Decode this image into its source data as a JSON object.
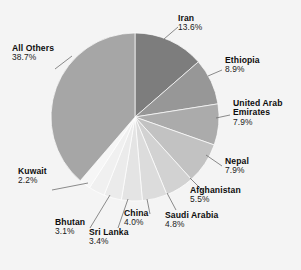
{
  "chart_data": {
    "type": "pie",
    "title": "",
    "subtitle": "",
    "xlabel": "",
    "ylabel": "",
    "legend_position": "none",
    "grid": false,
    "units": "percent",
    "categories": [
      "Iran",
      "Ethiopia",
      "United Arab Emirates",
      "Nepal",
      "Afghanistan",
      "Saudi Arabia",
      "China",
      "Sri Lanka",
      "Bhutan",
      "Kuwait",
      "All Others"
    ],
    "values": [
      13.6,
      8.9,
      7.9,
      7.9,
      5.5,
      4.8,
      4.0,
      3.4,
      3.1,
      2.2,
      38.7
    ],
    "slice_colors": [
      "#7d7d7d",
      "#979797",
      "#ababab",
      "#c2c2c2",
      "#d2d2d2",
      "#dcdcdc",
      "#e4e4e4",
      "#ebebeb",
      "#f0f0f0",
      "#f6f6f6",
      "#a6a6a6"
    ],
    "slices": [
      {
        "label": "Iran",
        "value": 13.6,
        "percent_text": "13.6%",
        "color": "#7d7d7d"
      },
      {
        "label": "Ethiopia",
        "value": 8.9,
        "percent_text": "8.9%",
        "color": "#979797"
      },
      {
        "label": "United Arab Emirates",
        "value": 7.9,
        "percent_text": "7.9%",
        "color": "#ababab"
      },
      {
        "label": "Nepal",
        "value": 7.9,
        "percent_text": "7.9%",
        "color": "#c2c2c2"
      },
      {
        "label": "Afghanistan",
        "value": 5.5,
        "percent_text": "5.5%",
        "color": "#d2d2d2"
      },
      {
        "label": "Saudi Arabia",
        "value": 4.8,
        "percent_text": "4.8%",
        "color": "#dcdcdc"
      },
      {
        "label": "China",
        "value": 4.0,
        "percent_text": "4.0%",
        "color": "#e4e4e4"
      },
      {
        "label": "Sri Lanka",
        "value": 3.4,
        "percent_text": "3.4%",
        "color": "#ebebeb"
      },
      {
        "label": "Bhutan",
        "value": 3.1,
        "percent_text": "3.1%",
        "color": "#f0f0f0"
      },
      {
        "label": "Kuwait",
        "value": 2.2,
        "percent_text": "2.2%",
        "color": "#f6f6f6"
      },
      {
        "label": "All Others",
        "value": 38.7,
        "percent_text": "38.7%",
        "color": "#a6a6a6"
      }
    ],
    "background_color": "#f4f4f4"
  },
  "labels": {
    "iran": {
      "name": "Iran",
      "percent": "13.6%"
    },
    "ethiopia": {
      "name": "Ethiopia",
      "percent": "8.9%"
    },
    "uae": {
      "name": "United Arab",
      "name2": "Emirates",
      "percent": "7.9%"
    },
    "nepal": {
      "name": "Nepal",
      "percent": "7.9%"
    },
    "afghanistan": {
      "name": "Afghanistan",
      "percent": "5.5%"
    },
    "saudi": {
      "name": "Saudi Arabia",
      "percent": "4.8%"
    },
    "china": {
      "name": "China",
      "percent": "4.0%"
    },
    "srilanka": {
      "name": "Sri Lanka",
      "percent": "3.4%"
    },
    "bhutan": {
      "name": "Bhutan",
      "percent": "3.1%"
    },
    "kuwait": {
      "name": "Kuwait",
      "percent": "2.2%"
    },
    "allothers": {
      "name": "All Others",
      "percent": "38.7%"
    }
  }
}
